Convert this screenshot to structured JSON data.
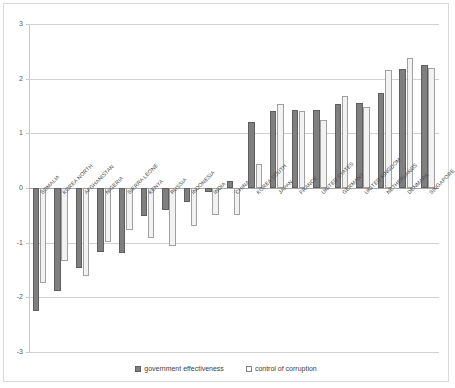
{
  "chart_data": {
    "type": "bar",
    "title": "",
    "xlabel": "",
    "ylabel": "",
    "ylim": [
      -3,
      3
    ],
    "ytick_labels": [
      "3",
      "2",
      "1",
      "0",
      "-1",
      "-2",
      "-3"
    ],
    "yticks": [
      3,
      2,
      1,
      0,
      -1,
      -2,
      -3
    ],
    "grid": true,
    "legend_position": "bottom",
    "categories": [
      "SOMALIA",
      "KOREA NORTH",
      "AFGHANISTAN",
      "NIGERIA",
      "SIERRA LEONE",
      "KENYA",
      "RUSSIA",
      "INDONESIA",
      "INDIA",
      "CHINA",
      "KOREA SOUTH",
      "JAPAN",
      "FRANCE",
      "UNITED STATES",
      "GERMANY",
      "UNITED KINGDOM",
      "NETHERLANDS",
      "DENMARK",
      "SINGAPORE"
    ],
    "series": [
      {
        "name": "government effectiveness",
        "color": "#7f7f7f",
        "values": [
          -2.25,
          -1.89,
          -1.47,
          -1.17,
          -1.18,
          -0.51,
          -0.4,
          -0.26,
          -0.07,
          0.13,
          1.2,
          1.4,
          1.43,
          1.43,
          1.54,
          1.55,
          1.73,
          2.18,
          2.25
        ]
      },
      {
        "name": "control of corruption",
        "color": "#f2f2f2",
        "values": [
          -1.73,
          -1.33,
          -1.61,
          -0.99,
          -0.77,
          -0.91,
          -1.06,
          -0.7,
          -0.49,
          -0.5,
          0.43,
          1.53,
          1.4,
          1.25,
          1.69,
          1.48,
          2.15,
          2.38,
          2.19
        ]
      }
    ]
  },
  "legend": {
    "items": [
      {
        "label": "government effectiveness",
        "marker": "filled-square-icon"
      },
      {
        "label": "control of corruption",
        "marker": "empty-square-icon"
      }
    ]
  }
}
